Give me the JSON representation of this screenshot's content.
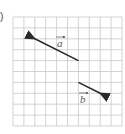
{
  "figure": {
    "part_marker": ")",
    "grid": {
      "columns": 10,
      "rows": 10,
      "origin_px": [
        13,
        17
      ],
      "cell_px": 10.9,
      "line_color": "#c8c8c8"
    },
    "vectors": [
      {
        "name": "a",
        "label": "a",
        "tail_grid": [
          6,
          4
        ],
        "head_grid": [
          2,
          2
        ],
        "components": [
          -4,
          2
        ],
        "color": "#2a2a2a"
      },
      {
        "name": "b",
        "label": "b",
        "tail_grid": [
          6,
          6
        ],
        "head_grid": [
          8,
          7
        ],
        "components": [
          2,
          -1
        ],
        "color": "#2a2a2a"
      }
    ]
  }
}
